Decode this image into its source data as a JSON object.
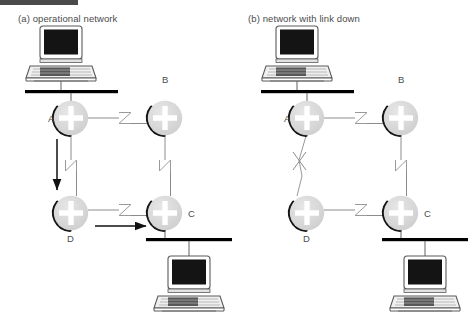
{
  "figure": {
    "type": "network-diagram",
    "top_rule_color": "#4a4a4a",
    "panels": [
      {
        "id": "a",
        "caption": "(a) operational network",
        "routers": [
          {
            "name": "A",
            "label": "A",
            "label_pos": "left",
            "x": 71,
            "y": 118
          },
          {
            "name": "B",
            "label": "B",
            "label_pos": "above",
            "x": 165,
            "y": 118
          },
          {
            "name": "D",
            "label": "D",
            "label_pos": "below",
            "x": 71,
            "y": 213
          },
          {
            "name": "C",
            "label": "C",
            "label_pos": "right",
            "x": 165,
            "y": 213
          }
        ],
        "hosts": [
          {
            "name": "top-laptop",
            "icon": "laptop-icon",
            "x": 61,
            "y": 58,
            "bus": "top-bus"
          },
          {
            "name": "bottom-laptop",
            "icon": "laptop-icon",
            "x": 189,
            "y": 283,
            "bus": "bottom-bus"
          }
        ],
        "buses": [
          {
            "name": "top-bus",
            "x1": 25,
            "x2": 118,
            "y": 92
          },
          {
            "name": "bottom-bus",
            "x1": 146,
            "x2": 232,
            "y": 240
          }
        ],
        "links": [
          {
            "name": "link-a-b",
            "from": "A",
            "to": "B",
            "marker": "zigzag-z",
            "state": "up"
          },
          {
            "name": "link-b-c",
            "from": "B",
            "to": "C",
            "marker": "zigzag-z",
            "state": "up"
          },
          {
            "name": "link-a-d",
            "from": "A",
            "to": "D",
            "marker": "zigzag-z",
            "state": "up"
          },
          {
            "name": "link-d-c",
            "from": "D",
            "to": "C",
            "marker": "zigzag-z",
            "state": "up"
          }
        ],
        "flow_arrows": [
          {
            "name": "flow-arrow-a-to-d",
            "direction": "down",
            "from": "A",
            "to": "D"
          },
          {
            "name": "flow-arrow-d-to-c",
            "direction": "right",
            "from": "D",
            "to": "C"
          }
        ]
      },
      {
        "id": "b",
        "caption": "(b) network with link down",
        "routers": [
          {
            "name": "A",
            "label": "A",
            "label_pos": "left",
            "x": 71,
            "y": 118
          },
          {
            "name": "B",
            "label": "B",
            "label_pos": "above",
            "x": 165,
            "y": 118
          },
          {
            "name": "D",
            "label": "D",
            "label_pos": "below",
            "x": 71,
            "y": 213
          },
          {
            "name": "C",
            "label": "C",
            "label_pos": "right",
            "x": 165,
            "y": 213
          }
        ],
        "hosts": [
          {
            "name": "top-laptop",
            "icon": "laptop-icon",
            "x": 61,
            "y": 58,
            "bus": "top-bus"
          },
          {
            "name": "bottom-laptop",
            "icon": "laptop-icon",
            "x": 189,
            "y": 283,
            "bus": "bottom-bus"
          }
        ],
        "buses": [
          {
            "name": "top-bus",
            "x1": 25,
            "x2": 118,
            "y": 92
          },
          {
            "name": "bottom-bus",
            "x1": 146,
            "x2": 232,
            "y": 240
          }
        ],
        "links": [
          {
            "name": "link-a-b",
            "from": "A",
            "to": "B",
            "marker": "zigzag-z",
            "state": "up"
          },
          {
            "name": "link-b-c",
            "from": "B",
            "to": "C",
            "marker": "zigzag-z",
            "state": "up"
          },
          {
            "name": "link-a-d",
            "from": "A",
            "to": "D",
            "marker": "x-cross",
            "state": "down"
          },
          {
            "name": "link-d-c",
            "from": "D",
            "to": "C",
            "marker": "zigzag-z",
            "state": "up"
          }
        ],
        "flow_arrows": []
      }
    ],
    "colors": {
      "router_fill": "#d9d9d9",
      "router_cross": "#ffffff",
      "router_shadow": "#1a1a1a",
      "link_line": "#8c8c8c",
      "bus_bar": "#000000",
      "arrow": "#111111",
      "text": "#4b4b4b"
    }
  }
}
